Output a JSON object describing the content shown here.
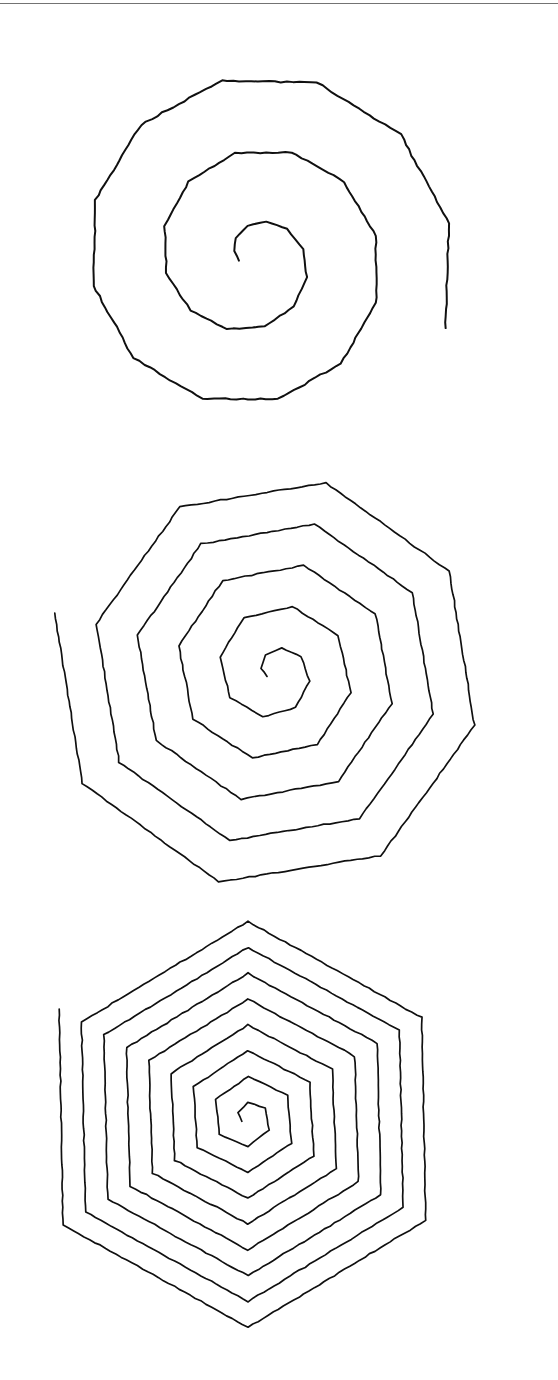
{
  "page": {
    "background_color": "#ffffff",
    "ink_color": "#101010",
    "width": 558,
    "height": 1380
  },
  "top_rule": {
    "name": "horizontal-rule",
    "y": 3,
    "color": "#5a5a5a"
  },
  "figures": [
    {
      "id": "spiral-1",
      "label": "Rounded polygonal spiral",
      "sides": 12,
      "turns": 2.6,
      "center": [
        253,
        258
      ],
      "start_radius": 14,
      "end_radius": 205,
      "start_angle_deg": 170,
      "stroke_width": 2.0,
      "jitter": 1.5,
      "bbox": [
        48,
        70,
        484,
        446
      ]
    },
    {
      "id": "spiral-2",
      "label": "Octagonal spiral",
      "sides": 8,
      "turns": 5.15,
      "center": [
        275,
        672
      ],
      "start_radius": 9,
      "end_radius": 228,
      "start_angle_deg": 150,
      "stroke_width": 1.7,
      "jitter": 1.1,
      "bbox": [
        42,
        464,
        534,
        884
      ]
    },
    {
      "id": "spiral-3",
      "label": "Hexagonal spiral",
      "sides": 6,
      "turns": 8.2,
      "center": [
        248,
        1118
      ],
      "start_radius": 7,
      "end_radius": 218,
      "start_angle_deg": 150,
      "stroke_width": 1.7,
      "jitter": 1.0,
      "bbox": [
        40,
        904,
        476,
        1324
      ]
    }
  ],
  "chart_data": {
    "type": "line",
    "xlabel": "",
    "ylabel": "",
    "series": [
      {
        "name": "Rounded polygonal spiral (12-gon)",
        "sides": 12,
        "turns": 2.6,
        "center_x": 253,
        "center_y": 258,
        "r_min": 14,
        "r_max": 205
      },
      {
        "name": "Octagonal spiral (8-gon)",
        "sides": 8,
        "turns": 5.15,
        "center_x": 275,
        "center_y": 672,
        "r_min": 9,
        "r_max": 228
      },
      {
        "name": "Hexagonal spiral (6-gon)",
        "sides": 6,
        "turns": 8.2,
        "center_x": 248,
        "center_y": 1118,
        "r_min": 7,
        "r_max": 218
      }
    ]
  }
}
